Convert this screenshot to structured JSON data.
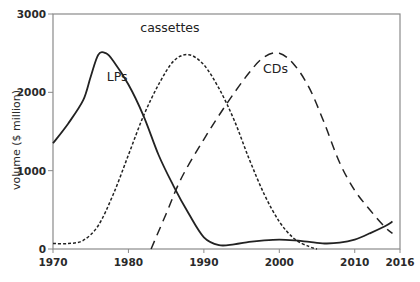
{
  "chart_data": {
    "type": "line",
    "title": "",
    "xlabel": "",
    "ylabel": "volume ($ million)",
    "xlim": [
      1970,
      2016
    ],
    "ylim": [
      0,
      3000
    ],
    "x_ticks": [
      1970,
      1980,
      1990,
      2000,
      2010,
      2016
    ],
    "y_ticks": [
      0,
      1000,
      2000,
      3000
    ],
    "grid": false,
    "legend": "inline labels near curve peaks",
    "series": [
      {
        "name": "LPs",
        "style": "solid",
        "label_pos": [
          1978.5,
          2150
        ],
        "points": [
          [
            1970,
            1350
          ],
          [
            1972,
            1600
          ],
          [
            1974,
            1900
          ],
          [
            1975,
            2200
          ],
          [
            1976,
            2480
          ],
          [
            1977,
            2500
          ],
          [
            1978,
            2400
          ],
          [
            1980,
            2100
          ],
          [
            1982,
            1700
          ],
          [
            1984,
            1200
          ],
          [
            1986,
            800
          ],
          [
            1988,
            450
          ],
          [
            1990,
            150
          ],
          [
            1992,
            50
          ],
          [
            1994,
            60
          ],
          [
            1996,
            90
          ],
          [
            1998,
            110
          ],
          [
            2000,
            120
          ],
          [
            2002,
            110
          ],
          [
            2004,
            90
          ],
          [
            2006,
            70
          ],
          [
            2008,
            80
          ],
          [
            2010,
            120
          ],
          [
            2012,
            200
          ],
          [
            2014,
            290
          ],
          [
            2015,
            350
          ]
        ]
      },
      {
        "name": "cassettes",
        "style": "dotted",
        "label_pos": [
          1985.5,
          2770
        ],
        "points": [
          [
            1970,
            70
          ],
          [
            1972,
            70
          ],
          [
            1974,
            110
          ],
          [
            1976,
            300
          ],
          [
            1978,
            700
          ],
          [
            1980,
            1200
          ],
          [
            1982,
            1700
          ],
          [
            1984,
            2100
          ],
          [
            1986,
            2400
          ],
          [
            1988,
            2480
          ],
          [
            1990,
            2350
          ],
          [
            1992,
            2050
          ],
          [
            1994,
            1650
          ],
          [
            1996,
            1150
          ],
          [
            1998,
            700
          ],
          [
            2000,
            350
          ],
          [
            2002,
            130
          ],
          [
            2004,
            30
          ],
          [
            2005,
            0
          ]
        ]
      },
      {
        "name": "CDs",
        "style": "dashed",
        "label_pos": [
          1999.5,
          2250
        ],
        "points": [
          [
            1983,
            0
          ],
          [
            1985,
            450
          ],
          [
            1987,
            900
          ],
          [
            1990,
            1400
          ],
          [
            1993,
            1850
          ],
          [
            1996,
            2250
          ],
          [
            1998,
            2450
          ],
          [
            2000,
            2500
          ],
          [
            2002,
            2350
          ],
          [
            2004,
            2050
          ],
          [
            2006,
            1600
          ],
          [
            2008,
            1100
          ],
          [
            2010,
            750
          ],
          [
            2012,
            500
          ],
          [
            2014,
            280
          ],
          [
            2015,
            200
          ]
        ]
      }
    ]
  },
  "colors": {
    "axis": "#8a8a8a",
    "line": "#222222",
    "text": "#2a2a2a"
  }
}
